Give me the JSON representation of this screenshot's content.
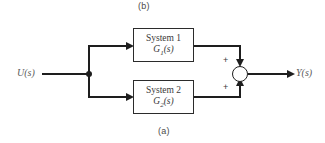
{
  "figure": {
    "caption_top": "(b)",
    "caption_bottom": "(a)",
    "type": "block-diagram"
  },
  "signals": {
    "input_label": "U(s)",
    "output_label": "Y(s)"
  },
  "blocks": [
    {
      "id": "system1",
      "title": "System 1",
      "transfer_function_base": "G",
      "transfer_function_index": "1",
      "transfer_function_arg": "(s)"
    },
    {
      "id": "system2",
      "title": "System 2",
      "transfer_function_base": "G",
      "transfer_function_index": "2",
      "transfer_function_arg": "(s)"
    }
  ],
  "summing_junction": {
    "sign_top": "+",
    "sign_bottom": "+"
  },
  "colors": {
    "line": "#1e1e1e",
    "block_border": "#2b2b2b",
    "text": "#3a3a3a",
    "caption": "#4a4a4a",
    "signal_text": "#5a5a5a",
    "background": "#ffffff"
  }
}
